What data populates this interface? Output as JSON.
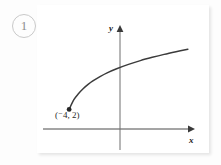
{
  "problem": {
    "number": "1"
  },
  "chart_data": {
    "type": "line",
    "title": "",
    "subtitle": "",
    "xlabel": "x",
    "ylabel": "y",
    "grid": false,
    "legend": null,
    "axes": {
      "x_axis": {
        "label": "x",
        "arrow": "right",
        "tick_labels": []
      },
      "y_axis": {
        "label": "y",
        "arrow": "up",
        "tick_labels": []
      },
      "origin_shown": true
    },
    "series": [
      {
        "name": "radical-curve",
        "description": "square root type curve increasing and concave down",
        "endpoint_style": "closed-dot",
        "x": [
          -4.0,
          -3.6,
          -3.2,
          -2.8,
          -2.4,
          -2.0,
          -1.4,
          -0.8,
          0.0,
          1.0,
          2.0,
          3.0,
          4.0,
          5.0,
          6.0
        ],
        "y": [
          2.0,
          2.62,
          3.02,
          3.34,
          3.6,
          3.82,
          4.1,
          4.34,
          4.6,
          4.88,
          5.12,
          5.33,
          5.52,
          5.69,
          5.85
        ]
      }
    ],
    "annotations": [
      {
        "name": "endpoint-label",
        "text": "(⁻4, 2)",
        "x": -4.0,
        "y": 2.0,
        "marker": "filled-circle"
      }
    ],
    "xlim": [
      -6.2,
      6.6
    ],
    "ylim": [
      -0.6,
      7.4
    ]
  }
}
